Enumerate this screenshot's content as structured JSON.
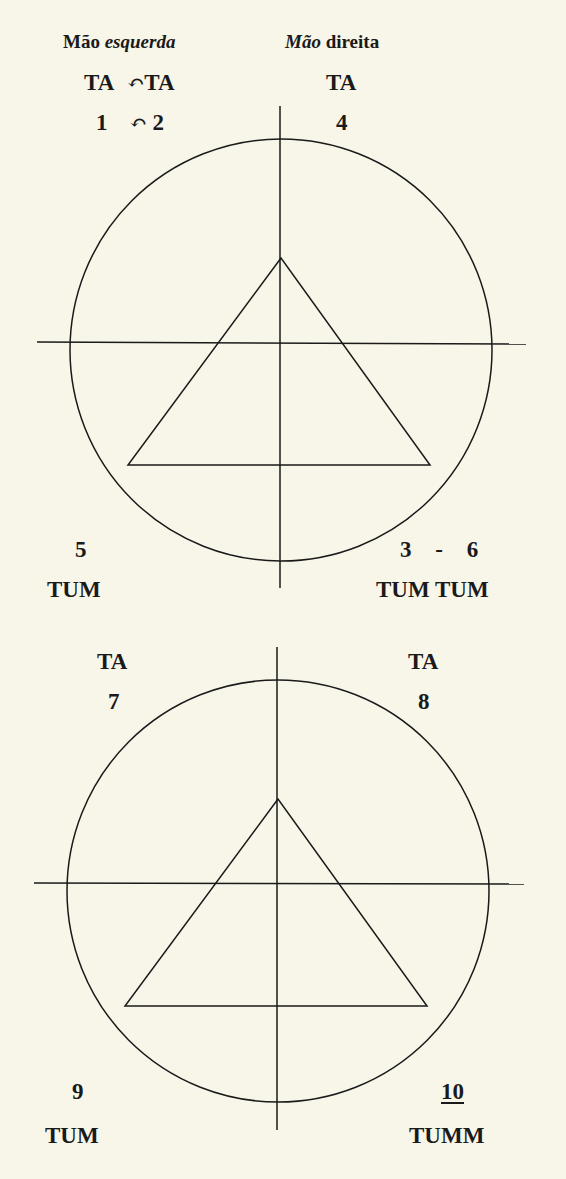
{
  "header": {
    "left_hand": {
      "word1": "Mão",
      "word2": "esquerda",
      "word2_style": "italic"
    },
    "right_hand": {
      "word1": "Mão",
      "word1_style": "italic",
      "word2": "direita"
    }
  },
  "top_diagram": {
    "syllables_top_left": [
      "TA",
      "TA"
    ],
    "numbers_top_left": [
      "1",
      "2"
    ],
    "link_symbol": "↶",
    "syllable_top_right": "TA",
    "number_top_right": "4",
    "number_bottom_left": "5",
    "syllable_bottom_left": "TUM",
    "numbers_bottom_right": [
      "3",
      "-",
      "6"
    ],
    "syllables_bottom_right": "TUM TUM"
  },
  "bottom_diagram": {
    "syllable_top_left": "TA",
    "number_top_left": "7",
    "syllable_top_right": "TA",
    "number_top_right": "8",
    "number_bottom_left": "9",
    "syllable_bottom_left": "TUM",
    "number_bottom_right": "10",
    "syllable_bottom_right": "TUMM"
  },
  "colors": {
    "background": "#f8f6e9",
    "ink": "#1a1a1a"
  }
}
